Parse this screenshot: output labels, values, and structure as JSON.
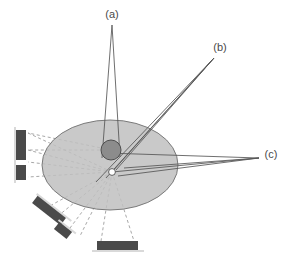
{
  "figure": {
    "type": "geometry-diagram",
    "caption_labels": [
      {
        "id": "a",
        "text": "(a)",
        "x": 112,
        "y": 18
      },
      {
        "id": "b",
        "text": "(b)",
        "x": 220,
        "y": 51
      },
      {
        "id": "c",
        "text": "(c)",
        "x": 271,
        "y": 158
      }
    ],
    "colors": {
      "background": "#ffffff",
      "body_fill": "#bfbfbf",
      "body_stroke": "#7a7a7a",
      "occluder_fill": "#8c8c8c",
      "occluder_stroke": "#4d4d4d",
      "source_fill": "#ffffff",
      "source_stroke": "#4d4d4d",
      "detector_fill": "#4a4a4a",
      "detector_backing": "#d9d9d9",
      "ray_stroke": "#555555",
      "dashed_stroke": "#909090",
      "label_text": "#4a4a4a"
    },
    "body": {
      "name": "elliptical-phantom",
      "cx": 110,
      "cy": 165,
      "rx": 68,
      "ry": 45
    },
    "occluder": {
      "name": "occluding-disc",
      "cx": 111,
      "cy": 150,
      "r": 10
    },
    "source": {
      "name": "point-source",
      "cx": 112,
      "cy": 172,
      "r": 3.4
    },
    "apexes": {
      "a": {
        "x": 112,
        "y": 25
      },
      "b": {
        "x": 214,
        "y": 58
      },
      "c": {
        "x": 259,
        "y": 158
      }
    },
    "ray_bundles": [
      {
        "id": "a",
        "label": "(a)",
        "apex": {
          "x": 112,
          "y": 25
        },
        "targets": [
          {
            "x": 102,
            "y": 158
          },
          {
            "x": 120,
            "y": 157
          }
        ]
      },
      {
        "id": "b",
        "label": "(b)",
        "apex": {
          "x": 214,
          "y": 58
        },
        "targets": [
          {
            "x": 96,
            "y": 182
          },
          {
            "x": 106,
            "y": 178
          },
          {
            "x": 112,
            "y": 172
          },
          {
            "x": 116,
            "y": 170
          }
        ]
      },
      {
        "id": "c",
        "label": "(c)",
        "apex": {
          "x": 259,
          "y": 158
        },
        "targets": [
          {
            "x": 106,
            "y": 153
          },
          {
            "x": 112,
            "y": 172
          },
          {
            "x": 118,
            "y": 176
          },
          {
            "x": 124,
            "y": 168
          }
        ]
      }
    ],
    "detectors": [
      {
        "name": "detector-left-upper",
        "x": 16,
        "y": 130,
        "w": 10,
        "h": 30,
        "rotation": 0,
        "backing": {
          "x": 14,
          "y": 127,
          "w": 2,
          "h": 56
        }
      },
      {
        "name": "detector-left-lower",
        "x": 16,
        "y": 165,
        "w": 10,
        "h": 15,
        "rotation": 0,
        "backing": null
      },
      {
        "name": "detector-lower-left-long",
        "x": 31,
        "y": 206,
        "w": 36,
        "h": 9,
        "rotation": 38,
        "backing": {
          "x": 29,
          "y": 204,
          "w": 44,
          "h": 2
        }
      },
      {
        "name": "detector-lower-left-short",
        "x": 55,
        "y": 226,
        "w": 16,
        "h": 9,
        "rotation": 38,
        "backing": {
          "x": 53,
          "y": 224,
          "w": 22,
          "h": 2
        }
      },
      {
        "name": "detector-bottom",
        "x": 97,
        "y": 241,
        "w": 41,
        "h": 9,
        "rotation": 0,
        "backing": {
          "x": 92,
          "y": 250,
          "w": 52,
          "h": 2
        }
      }
    ],
    "dashed_fan": {
      "origin": {
        "x": 112,
        "y": 172
      },
      "rays": [
        {
          "x": 28,
          "y": 133
        },
        {
          "x": 28,
          "y": 150
        },
        {
          "x": 28,
          "y": 162
        },
        {
          "x": 28,
          "y": 177
        },
        {
          "x": 46,
          "y": 208
        },
        {
          "x": 58,
          "y": 216
        },
        {
          "x": 70,
          "y": 228
        },
        {
          "x": 80,
          "y": 236
        },
        {
          "x": 101,
          "y": 241
        },
        {
          "x": 134,
          "y": 241
        }
      ]
    },
    "dashed_extra": {
      "origin": {
        "x": 111,
        "y": 150
      },
      "rays": [
        {
          "x": 28,
          "y": 133
        },
        {
          "x": 28,
          "y": 150
        }
      ]
    }
  }
}
